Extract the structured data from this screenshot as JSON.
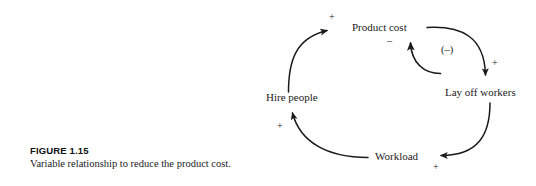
{
  "figure": {
    "number": "FIGURE 1.15",
    "caption": "Variable relationship to reduce the product cost."
  },
  "diagram": {
    "type": "causal-loop-diagram",
    "stroke_color": "#1a1a1a",
    "background_color": "#ffffff",
    "nodes": [
      {
        "id": "product-cost",
        "label": "Product cost",
        "x": 352,
        "y": 22
      },
      {
        "id": "lay-off-workers",
        "label": "Lay off workers",
        "x": 445,
        "y": 87
      },
      {
        "id": "workload",
        "label": "Workload",
        "x": 375,
        "y": 151
      },
      {
        "id": "hire-people",
        "label": "Hire people",
        "x": 266,
        "y": 92
      }
    ],
    "links": [
      {
        "id": "product-cost-to-lay-off-workers",
        "from": "product-cost",
        "to": "lay-off-workers",
        "polarity": "+"
      },
      {
        "id": "lay-off-workers-to-workload",
        "from": "lay-off-workers",
        "to": "workload",
        "polarity": "+"
      },
      {
        "id": "workload-to-hire-people",
        "from": "workload",
        "to": "hire-people",
        "polarity": "+"
      },
      {
        "id": "hire-people-to-product-cost",
        "from": "hire-people",
        "to": "product-cost",
        "polarity": "+"
      },
      {
        "id": "lay-off-workers-to-product-cost",
        "from": "lay-off-workers",
        "to": "product-cost",
        "polarity": "–"
      }
    ],
    "loop_label": "(–)",
    "signs": [
      {
        "id": "sign-hire-people-to-product-cost",
        "text": "+",
        "x": 329,
        "y": 12
      },
      {
        "id": "sign-lay-off-workers-to-product-cost",
        "text": "–",
        "x": 387,
        "y": 36
      },
      {
        "id": "sign-loop-polarity",
        "text": "(–)",
        "x": 441,
        "y": 45
      },
      {
        "id": "sign-product-cost-to-lay-off-workers",
        "text": "+",
        "x": 492,
        "y": 58
      },
      {
        "id": "sign-workload-to-hire-people",
        "text": "+",
        "x": 277,
        "y": 121
      },
      {
        "id": "sign-lay-off-workers-to-workload",
        "text": "+",
        "x": 433,
        "y": 162
      }
    ]
  }
}
